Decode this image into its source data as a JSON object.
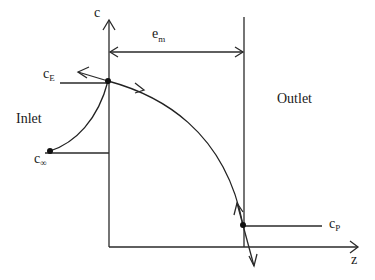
{
  "diagram": {
    "axes": {
      "y_label": "c",
      "x_label": "z"
    },
    "dimension": {
      "label_main": "e",
      "label_sub": "m"
    },
    "regions": {
      "inlet": "Inlet",
      "outlet": "Outlet"
    },
    "points": {
      "c_E": {
        "main": "c",
        "sub": "E"
      },
      "c_inf": {
        "main": "c",
        "sub": "∞"
      },
      "c_P": {
        "main": "c",
        "sub": "P"
      }
    },
    "colors": {
      "line": "#2a2a2a",
      "background": "#ffffff"
    }
  }
}
